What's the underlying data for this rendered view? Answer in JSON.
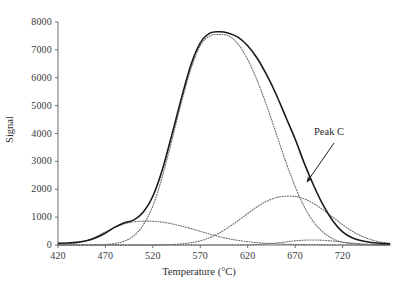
{
  "figure": {
    "background_color": "#ffffff",
    "frame": {
      "left": 58,
      "right": 390,
      "top": 22,
      "bottom": 245
    }
  },
  "axes": {
    "x": {
      "title": "Temperature (°C)",
      "ticks": [
        420,
        470,
        520,
        570,
        620,
        670,
        720
      ],
      "tick_labels": [
        "420",
        "470",
        "520",
        "570",
        "620",
        "670",
        "720"
      ],
      "range": [
        420,
        770
      ]
    },
    "y": {
      "title": "Signal",
      "ticks": [
        0,
        1000,
        2000,
        3000,
        4000,
        5000,
        6000,
        7000,
        8000
      ],
      "tick_labels": [
        "0",
        "1000",
        "2000",
        "3000",
        "4000",
        "5000",
        "6000",
        "7000",
        "8000"
      ],
      "range": [
        0,
        8000
      ]
    }
  },
  "annotations": [
    {
      "name": "peak-c",
      "text": "Peak C",
      "label_x": 314,
      "label_y": 126,
      "arrow_from": [
        334,
        143
      ],
      "arrow_to": [
        307,
        182
      ]
    }
  ],
  "colors": {
    "axis": "#6e6e6e",
    "total_curve": "#1a1a1a",
    "component_curve": "#6b6b6b",
    "text": "#2b2b2b"
  },
  "chart_data": {
    "type": "line",
    "title": "",
    "xlabel": "Temperature (°C)",
    "ylabel": "Signal",
    "xlim": [
      420,
      770
    ],
    "ylim": [
      0,
      8000
    ],
    "grid": false,
    "legend": false,
    "legend_position": "none",
    "annotations": [
      "Peak C"
    ],
    "x": [
      420,
      430,
      440,
      450,
      460,
      470,
      480,
      490,
      500,
      510,
      520,
      530,
      540,
      550,
      560,
      570,
      580,
      590,
      600,
      610,
      620,
      630,
      640,
      650,
      660,
      670,
      680,
      690,
      700,
      710,
      720,
      730,
      740,
      750,
      760,
      770
    ],
    "series": [
      {
        "name": "Total signal",
        "style": "solid",
        "values": [
          60,
          70,
          95,
          150,
          260,
          430,
          640,
          800,
          900,
          1180,
          1750,
          2700,
          3950,
          5250,
          6450,
          7250,
          7600,
          7650,
          7600,
          7450,
          7150,
          6700,
          6100,
          5400,
          4600,
          3800,
          2900,
          2100,
          1400,
          850,
          470,
          260,
          150,
          90,
          60,
          40
        ]
      },
      {
        "name": "Peak A",
        "style": "dotted",
        "peak_center": 520,
        "peak_height": 850,
        "values": [
          20,
          40,
          80,
          160,
          300,
          470,
          630,
          760,
          830,
          855,
          850,
          820,
          760,
          680,
          590,
          490,
          390,
          300,
          225,
          165,
          120,
          85,
          60,
          42,
          28,
          19,
          12,
          8,
          5,
          3,
          2,
          1,
          1,
          0,
          0,
          0
        ]
      },
      {
        "name": "Peak B",
        "style": "dotted",
        "peak_center": 600,
        "peak_height": 7550,
        "values": [
          0,
          0,
          1,
          3,
          8,
          20,
          55,
          140,
          330,
          730,
          1400,
          2450,
          3750,
          5100,
          6300,
          7150,
          7500,
          7550,
          7500,
          7200,
          6650,
          5900,
          5000,
          4000,
          3000,
          2100,
          1350,
          800,
          440,
          220,
          100,
          45,
          18,
          7,
          3,
          1
        ]
      },
      {
        "name": "Peak C",
        "style": "dotted",
        "peak_center": 673,
        "peak_height": 1750,
        "values": [
          0,
          0,
          0,
          0,
          0,
          0,
          0,
          0,
          0,
          1,
          3,
          8,
          18,
          40,
          80,
          150,
          265,
          430,
          640,
          880,
          1130,
          1370,
          1570,
          1700,
          1750,
          1745,
          1650,
          1480,
          1250,
          990,
          730,
          500,
          320,
          190,
          105,
          55
        ]
      },
      {
        "name": "Peak D",
        "style": "dotted",
        "peak_center": 692,
        "peak_height": 180,
        "values": [
          0,
          0,
          0,
          0,
          0,
          0,
          0,
          0,
          0,
          0,
          0,
          0,
          0,
          0,
          0,
          0,
          0,
          0,
          1,
          3,
          8,
          18,
          38,
          70,
          110,
          150,
          175,
          180,
          168,
          140,
          105,
          70,
          42,
          24,
          12,
          6
        ]
      }
    ]
  }
}
